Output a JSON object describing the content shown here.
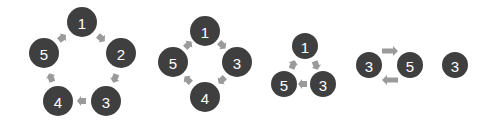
{
  "colors": {
    "node_fill": "#3f3f3f",
    "node_text": "#ffffff",
    "arrow": "#9a9a9a",
    "background": "#ffffff"
  },
  "groups": [
    {
      "name": "cycle-5",
      "nodes": [
        {
          "label": "1",
          "cx": 82,
          "cy": 22,
          "r": 15
        },
        {
          "label": "2",
          "cx": 121,
          "cy": 53,
          "r": 15
        },
        {
          "label": "3",
          "cx": 106,
          "cy": 101,
          "r": 15
        },
        {
          "label": "4",
          "cx": 58,
          "cy": 101,
          "r": 15
        },
        {
          "label": "5",
          "cx": 44,
          "cy": 53,
          "r": 15
        }
      ],
      "arrows": [
        {
          "x": 101,
          "y": 38,
          "angle": 40
        },
        {
          "x": 115,
          "y": 78,
          "angle": 110
        },
        {
          "x": 82,
          "y": 101,
          "angle": 180
        },
        {
          "x": 51,
          "y": 78,
          "angle": 250
        },
        {
          "x": 62,
          "y": 38,
          "angle": 320
        }
      ]
    },
    {
      "name": "cycle-4",
      "nodes": [
        {
          "label": "1",
          "cx": 205,
          "cy": 31,
          "r": 15
        },
        {
          "label": "3",
          "cx": 237,
          "cy": 62,
          "r": 15
        },
        {
          "label": "4",
          "cx": 205,
          "cy": 97,
          "r": 15
        },
        {
          "label": "5",
          "cx": 173,
          "cy": 62,
          "r": 15
        }
      ],
      "arrows": [
        {
          "x": 222,
          "y": 45,
          "angle": 45
        },
        {
          "x": 222,
          "y": 80,
          "angle": 135
        },
        {
          "x": 188,
          "y": 80,
          "angle": 225
        },
        {
          "x": 188,
          "y": 45,
          "angle": 315
        }
      ]
    },
    {
      "name": "cycle-3",
      "nodes": [
        {
          "label": "1",
          "cx": 305,
          "cy": 46,
          "r": 13
        },
        {
          "label": "3",
          "cx": 323,
          "cy": 84,
          "r": 13
        },
        {
          "label": "5",
          "cx": 284,
          "cy": 84,
          "r": 13
        }
      ],
      "arrows": [
        {
          "x": 316,
          "y": 65,
          "angle": 70
        },
        {
          "x": 303,
          "y": 84,
          "angle": 180
        },
        {
          "x": 293,
          "y": 65,
          "angle": 290
        }
      ]
    },
    {
      "name": "cycle-2",
      "nodes": [
        {
          "label": "3",
          "cx": 369,
          "cy": 65,
          "r": 13
        },
        {
          "label": "5",
          "cx": 410,
          "cy": 65,
          "r": 13
        }
      ],
      "block_arrows": [
        {
          "x1": 382,
          "x2": 398,
          "y": 51,
          "dir": "right"
        },
        {
          "x1": 382,
          "x2": 398,
          "y": 80,
          "dir": "left"
        }
      ]
    },
    {
      "name": "single",
      "nodes": [
        {
          "label": "3",
          "cx": 455,
          "cy": 65,
          "r": 13
        }
      ]
    }
  ]
}
